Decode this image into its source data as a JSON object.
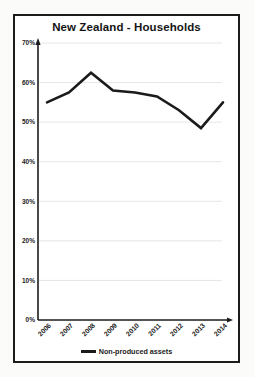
{
  "chart_data": {
    "type": "line",
    "title": "New Zealand - Households",
    "categories": [
      "2006",
      "2007",
      "2008",
      "2009",
      "2010",
      "2011",
      "2012",
      "2013",
      "2014"
    ],
    "series": [
      {
        "name": "Non-produced assets",
        "values": [
          55,
          57.5,
          62.5,
          58,
          57.5,
          56.5,
          53,
          48.5,
          55
        ]
      }
    ],
    "xlabel": "",
    "ylabel": "",
    "ylim": [
      0,
      70
    ],
    "yticks": [
      0,
      10,
      20,
      30,
      40,
      50,
      60,
      70
    ],
    "ytick_labels": [
      "0%",
      "10%",
      "20%",
      "30%",
      "40%",
      "50%",
      "60%",
      "70%"
    ],
    "grid": true,
    "legend_position": "bottom",
    "colors": {
      "line": "#1b1b1b",
      "grid": "#e6e6e2",
      "axis": "#1b1b1b",
      "text": "#1b1b1b",
      "frame_border": "#1c1c1c",
      "plot_background": "#ffffff",
      "page_background": "#fbfbf9"
    }
  }
}
